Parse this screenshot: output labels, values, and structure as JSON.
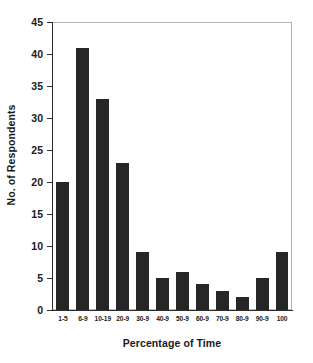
{
  "chart_data": {
    "type": "bar",
    "title": "",
    "xlabel": "Percentage of Time",
    "ylabel": "No. of Respondents",
    "categories": [
      "1-5",
      "6-9",
      "10-19",
      "20-9",
      "30-9",
      "40-9",
      "50-9",
      "60-9",
      "70-9",
      "80-9",
      "90-9",
      "100"
    ],
    "values": [
      20,
      41,
      33,
      23,
      9,
      5,
      6,
      4,
      3,
      2,
      5,
      9
    ],
    "ylim": [
      0,
      45
    ],
    "ytick_labels": [
      "45",
      "40",
      "35",
      "30",
      "25",
      "20",
      "15",
      "10",
      "5",
      "0"
    ],
    "ytick_values": [
      45,
      40,
      35,
      30,
      25,
      20,
      15,
      10,
      5,
      0
    ],
    "grid": false,
    "legend": false,
    "bar_color": "#262626",
    "axis_color": "#2b2b2b",
    "frame_color": "#b9b9b9",
    "background": "#ffffff"
  }
}
